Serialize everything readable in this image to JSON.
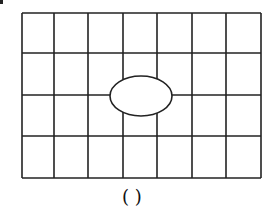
{
  "grid": {
    "columns": 7,
    "rows": 4,
    "x_lines": [
      22,
      54,
      88,
      123,
      157,
      192,
      226,
      261
    ],
    "y_lines": [
      13,
      53,
      95,
      136,
      178
    ],
    "stroke": "#222222",
    "stroke_width": 1.6
  },
  "ellipse": {
    "cx": 141,
    "cy": 96,
    "rx": 31,
    "ry": 20,
    "fill": "#ffffff",
    "stroke": "#222222"
  },
  "answer_blank": {
    "text": "(      )"
  }
}
